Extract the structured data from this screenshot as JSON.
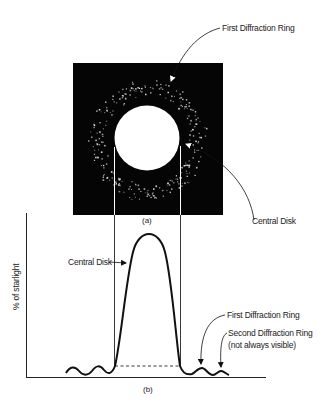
{
  "figure": {
    "panel_a": {
      "label": "(a)",
      "description": "Airy pattern image: bright central disk surrounded by a speckled first diffraction ring on black background",
      "annotations": {
        "first_ring": "First Diffraction Ring",
        "central_disk": "Central Disk"
      }
    },
    "panel_b": {
      "label": "(b)",
      "ylabel": "% of starlight",
      "annotations": {
        "central_disk": "Central Disk",
        "first_ring": "First Diffraction Ring",
        "second_ring_line1": "Second Diffraction Ring",
        "second_ring_line2": "(not always visible)"
      }
    }
  },
  "colors": {
    "background": "#ffffff",
    "ink": "#111111",
    "image_bg": "#050505",
    "disk": "#ffffff"
  }
}
